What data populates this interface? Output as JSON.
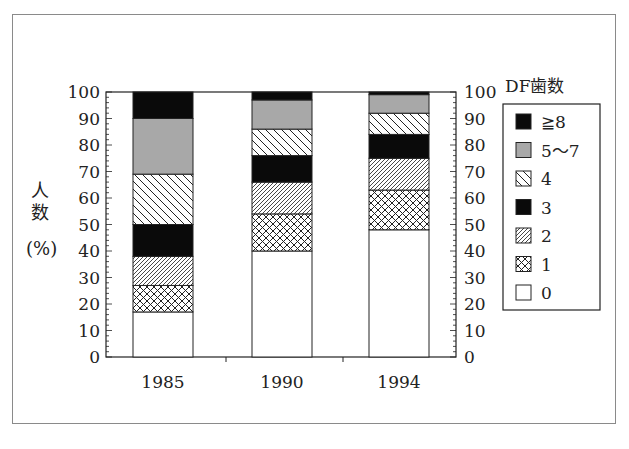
{
  "chart_data": {
    "type": "bar",
    "stacked": true,
    "percent": true,
    "title": "",
    "xlabel": "",
    "ylabel": "人数（%）",
    "ylim": [
      0,
      100
    ],
    "yticks": [
      0,
      10,
      20,
      30,
      40,
      50,
      60,
      70,
      80,
      90,
      100
    ],
    "secondary_yaxis": true,
    "grid": false,
    "categories": [
      "1985",
      "1990",
      "1994"
    ],
    "legend_title": "DF歯数",
    "legend_position": "right",
    "series": [
      {
        "name": "0",
        "pattern": "white",
        "values": [
          17,
          40,
          48
        ]
      },
      {
        "name": "1",
        "pattern": "crosshatch",
        "values": [
          10,
          14,
          15
        ]
      },
      {
        "name": "2",
        "pattern": "fine-diagonal",
        "values": [
          11,
          12,
          12
        ]
      },
      {
        "name": "3",
        "pattern": "black",
        "values": [
          12,
          10,
          9
        ]
      },
      {
        "name": "4",
        "pattern": "back-diagonal",
        "values": [
          19,
          10,
          8
        ]
      },
      {
        "name": "5〜7",
        "pattern": "gray",
        "values": [
          21,
          11,
          7
        ]
      },
      {
        "name": "≧8",
        "pattern": "black",
        "values": [
          10,
          3,
          1
        ]
      }
    ]
  },
  "ylabel_chars": [
    "人",
    "数",
    "%"
  ],
  "legend": {
    "title": "DF歯数",
    "items": [
      {
        "label": "≧8",
        "pattern": "black"
      },
      {
        "label": "5〜7",
        "pattern": "gray"
      },
      {
        "label": "4",
        "pattern": "back-diagonal"
      },
      {
        "label": "3",
        "pattern": "black"
      },
      {
        "label": "2",
        "pattern": "fine-diagonal"
      },
      {
        "label": "1",
        "pattern": "crosshatch"
      },
      {
        "label": "0",
        "pattern": "white"
      }
    ]
  },
  "colors": {
    "black": "#0a0a0a",
    "gray": "#a8a8a8",
    "line": "#222222"
  }
}
